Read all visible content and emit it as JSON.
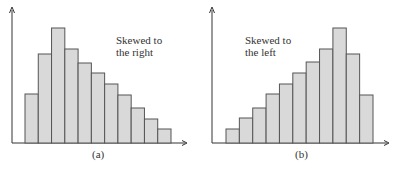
{
  "chart_data": [
    {
      "type": "bar",
      "title": "",
      "annotation": [
        "Skewed to",
        "the right"
      ],
      "caption": "(a)",
      "xlabel": "",
      "ylabel": "",
      "categories": [
        "1",
        "2",
        "3",
        "4",
        "5",
        "6",
        "7",
        "8",
        "9",
        "10",
        "11"
      ],
      "values": [
        49,
        89,
        115,
        94,
        80,
        70,
        59,
        48,
        35,
        24,
        14
      ],
      "ylim": [
        0,
        134
      ],
      "grid": false,
      "style": {
        "fill": "#d9d9d9",
        "stroke": "#555555"
      }
    },
    {
      "type": "bar",
      "title": "",
      "annotation": [
        "Skewed to",
        "the left"
      ],
      "caption": "(b)",
      "xlabel": "",
      "ylabel": "",
      "categories": [
        "1",
        "2",
        "3",
        "4",
        "5",
        "6",
        "7",
        "8",
        "9",
        "10",
        "11"
      ],
      "values": [
        14,
        25,
        35,
        49,
        59,
        70,
        81,
        94,
        115,
        89,
        48
      ],
      "ylim": [
        0,
        134
      ],
      "grid": false,
      "style": {
        "fill": "#d9d9d9",
        "stroke": "#555555"
      }
    }
  ]
}
